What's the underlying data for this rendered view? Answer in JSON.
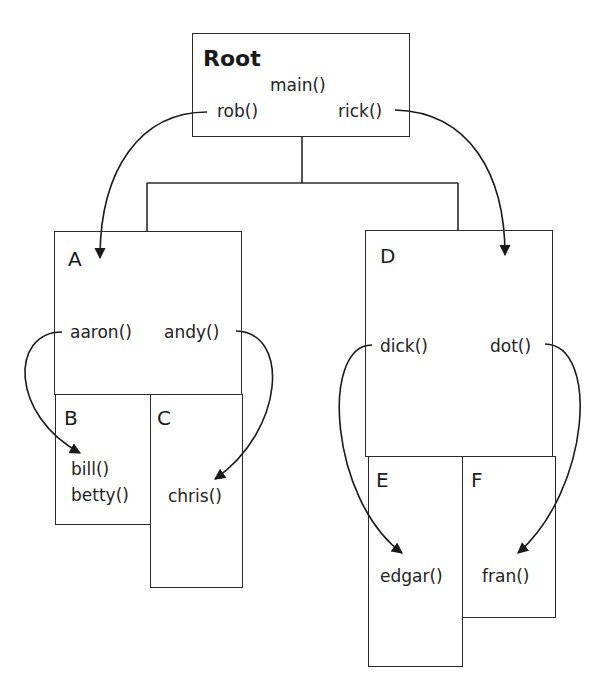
{
  "diagram": {
    "type": "scope-nesting / call graph",
    "nodes": {
      "root": {
        "label": "Root",
        "functions": [
          "main()",
          "rob()",
          "rick()"
        ]
      },
      "A": {
        "label": "A",
        "functions": [
          "aaron()",
          "andy()"
        ]
      },
      "B": {
        "label": "B",
        "functions": [
          "bill()",
          "betty()"
        ]
      },
      "C": {
        "label": "C",
        "functions": [
          "chris()"
        ]
      },
      "D": {
        "label": "D",
        "functions": [
          "dick()",
          "dot()"
        ]
      },
      "E": {
        "label": "E",
        "functions": [
          "edgar()"
        ]
      },
      "F": {
        "label": "F",
        "functions": [
          "fran()"
        ]
      }
    },
    "tree_edges": [
      {
        "from": "Root",
        "to": "A"
      },
      {
        "from": "Root",
        "to": "D"
      },
      {
        "from": "A",
        "to": "B"
      },
      {
        "from": "A",
        "to": "C"
      },
      {
        "from": "D",
        "to": "E"
      },
      {
        "from": "D",
        "to": "F"
      }
    ],
    "call_arrows": [
      {
        "from": "rob()",
        "to": "A"
      },
      {
        "from": "rick()",
        "to": "D"
      },
      {
        "from": "aaron()",
        "to": "bill()"
      },
      {
        "from": "andy()",
        "to": "chris()"
      },
      {
        "from": "dick()",
        "to": "edgar()"
      },
      {
        "from": "dot()",
        "to": "fran()"
      }
    ],
    "line_color": "#2a2a2a"
  }
}
